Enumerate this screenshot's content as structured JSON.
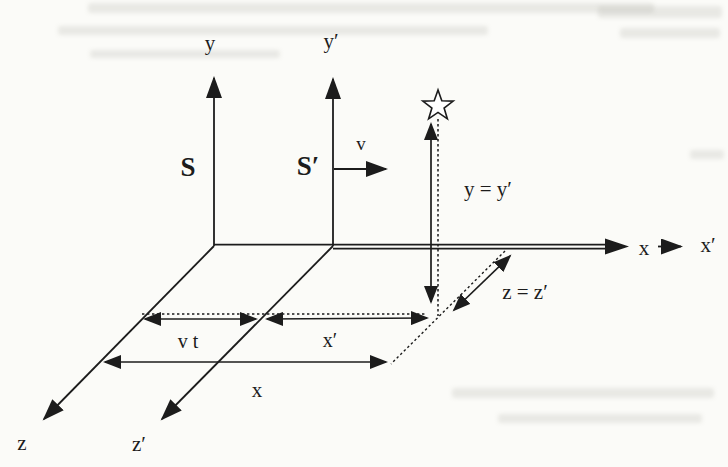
{
  "figure": {
    "background_color": "#fbfbf8",
    "ink_color": "#1c1c1c",
    "labels": {
      "y_axis": "y",
      "y_prime_axis": "y′",
      "frame_s": "S",
      "frame_s_prime": "S′",
      "velocity": "v",
      "height_equality": "y = y′",
      "x_axis": "x",
      "x_prime_axis": "x′",
      "depth_equality": "z = z′",
      "vt_distance": "v t",
      "x_prime_distance": "x′",
      "x_distance": "x",
      "z_axis": "z",
      "z_prime_axis": "z′"
    },
    "icons": {
      "event_marker": "star-icon",
      "axis_arrowheads": "arrowhead-icon"
    }
  }
}
